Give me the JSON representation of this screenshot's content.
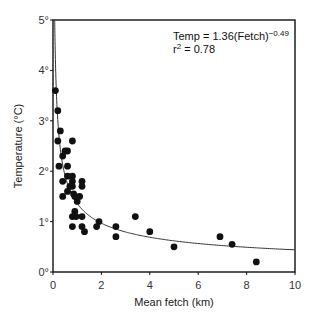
{
  "chart_data": {
    "type": "scatter",
    "title": "",
    "xlabel": "Mean fetch (km)",
    "ylabel": "Temperature (°C)",
    "xlim": [
      0,
      10
    ],
    "ylim": [
      0,
      5
    ],
    "x_ticks": [
      "0",
      "2",
      "4",
      "6",
      "8",
      "10"
    ],
    "y_ticks": [
      "0°",
      "1°",
      "2°",
      "3°",
      "4°",
      "5°"
    ],
    "grid": false,
    "legend": null,
    "annotations": [
      {
        "text": "Temp = 1.36(Fetch)",
        "superscript": "−0.49",
        "position": "top-right"
      },
      {
        "text": "r",
        "superscript": "2",
        "suffix": " = 0.78",
        "position": "top-right"
      }
    ],
    "fit": {
      "type": "power",
      "a": 1.36,
      "b": -0.49,
      "r2": 0.78
    },
    "series": [
      {
        "name": "observations",
        "points": [
          [
            0.1,
            3.6
          ],
          [
            0.2,
            3.2
          ],
          [
            0.3,
            2.8
          ],
          [
            0.2,
            2.6
          ],
          [
            0.8,
            2.6
          ],
          [
            0.4,
            2.3
          ],
          [
            0.5,
            2.4
          ],
          [
            0.6,
            2.4
          ],
          [
            0.25,
            2.1
          ],
          [
            0.6,
            2.1
          ],
          [
            0.4,
            1.8
          ],
          [
            0.8,
            1.8
          ],
          [
            1.2,
            1.8
          ],
          [
            0.6,
            1.9
          ],
          [
            0.8,
            1.9
          ],
          [
            0.7,
            1.7
          ],
          [
            0.8,
            1.7
          ],
          [
            1.2,
            1.7
          ],
          [
            0.6,
            1.6
          ],
          [
            0.4,
            1.5
          ],
          [
            0.85,
            1.55
          ],
          [
            0.9,
            1.5
          ],
          [
            1.1,
            1.5
          ],
          [
            1.0,
            1.4
          ],
          [
            0.9,
            1.2
          ],
          [
            0.8,
            1.1
          ],
          [
            0.95,
            1.1
          ],
          [
            1.2,
            1.1
          ],
          [
            0.8,
            0.9
          ],
          [
            1.2,
            0.9
          ],
          [
            1.3,
            0.8
          ],
          [
            1.8,
            0.9
          ],
          [
            1.9,
            1.0
          ],
          [
            2.6,
            0.9
          ],
          [
            2.6,
            0.7
          ],
          [
            3.4,
            1.1
          ],
          [
            4.0,
            0.8
          ],
          [
            5.0,
            0.5
          ],
          [
            6.9,
            0.7
          ],
          [
            7.4,
            0.55
          ],
          [
            8.4,
            0.2
          ]
        ]
      }
    ]
  },
  "labels": {
    "xlabel": "Mean fetch (km)",
    "ylabel": "Temperature (°C)",
    "eq_main": "Temp = 1.36(Fetch)",
    "eq_exp": "−0.49",
    "r2_r": "r",
    "r2_exp": "2",
    "r2_val": " = 0.78"
  }
}
